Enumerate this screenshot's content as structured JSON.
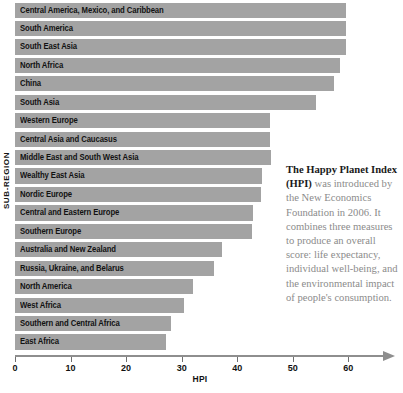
{
  "chart_data": {
    "type": "bar",
    "orientation": "horizontal",
    "title": "",
    "xlabel": "HPI",
    "ylabel": "SUB-REGION",
    "xlim": [
      0,
      63
    ],
    "xticks": [
      0,
      10,
      20,
      30,
      40,
      50,
      60
    ],
    "grid": false,
    "legend": null,
    "bar_color": "#a3a3a3",
    "categories": [
      "Central America, Mexico, and Caribbean",
      "South America",
      "South East Asia",
      "North Africa",
      "China",
      "South Asia",
      "Western Europe",
      "Central Asia and Caucasus",
      "Middle East and South West Asia",
      "Wealthy East Asia",
      "Nordic Europe",
      "Central and Eastern Europe",
      "Southern Europe",
      "Australia and New Zealand",
      "Russia, Ukraine, and Belarus",
      "North America",
      "West Africa",
      "Southern and Central Africa",
      "East Africa"
    ],
    "values": [
      59.6,
      59.6,
      59.5,
      58.5,
      57.5,
      54.1,
      45.9,
      45.9,
      46.0,
      44.5,
      44.3,
      42.9,
      42.7,
      37.3,
      35.9,
      32.1,
      30.4,
      28.0,
      27.1
    ]
  },
  "axis": {
    "y_title": "SUB-REGION",
    "x_title": "HPI",
    "x_tick_labels": [
      "0",
      "10",
      "20",
      "30",
      "40",
      "50",
      "60"
    ]
  },
  "note": {
    "bold_lead": "The Happy Planet Index (HPI)",
    "body": " was introduced by the New Economics Foundation in 2006. It combines three measures to produce an overall score: life expectancy, individual well-being, and the environmental impact of people's consumption."
  }
}
